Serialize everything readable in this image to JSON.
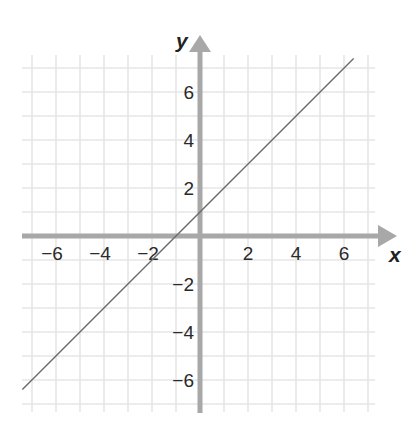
{
  "chart_data": {
    "type": "line",
    "title": "",
    "xlabel": "x",
    "ylabel": "y",
    "xlim": [
      -7.4,
      7.3
    ],
    "ylim": [
      -7.3,
      7.6
    ],
    "grid": true,
    "x_ticks": [
      -6,
      -4,
      -2,
      2,
      4,
      6
    ],
    "y_ticks": [
      6,
      4,
      2,
      -2,
      -4,
      -6
    ],
    "x_tick_labels": [
      "−6",
      "−4",
      "−2",
      "2",
      "4",
      "6"
    ],
    "y_tick_labels": [
      "6",
      "4",
      "2",
      "−2",
      "−4",
      "−6"
    ],
    "series": [
      {
        "name": "y = x + 1",
        "x": [
          -7.4,
          6.4
        ],
        "y": [
          -6.4,
          7.4
        ],
        "color": "#6a6a6a"
      }
    ],
    "legend": null
  },
  "colors": {
    "grid": "#e6e6e6",
    "axis": "#a8a8a8",
    "line": "#6a6a6a"
  }
}
